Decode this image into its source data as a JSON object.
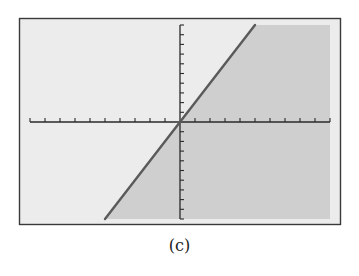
{
  "caption": "(c)",
  "colors": {
    "frame": "#3a3a3a",
    "screen_background": "#ececec",
    "shaded_region": "#cfcfcf",
    "line": "#5a5a5a",
    "axes": "#2a2a2a"
  },
  "chart_data": {
    "type": "area",
    "title": "",
    "caption": "(c)",
    "equation": "y = 2x",
    "inequality": "y <= 2x",
    "shaded": "below line",
    "xlabel": "",
    "ylabel": "",
    "xlim": [
      -10,
      10
    ],
    "ylim": [
      -10,
      10
    ],
    "xscale": 1,
    "yscale": 1,
    "grid": false,
    "legend": null,
    "tick_labels": false,
    "series": [
      {
        "name": "boundary line",
        "x": [
          -5,
          5
        ],
        "y": [
          -10,
          10
        ]
      }
    ]
  }
}
